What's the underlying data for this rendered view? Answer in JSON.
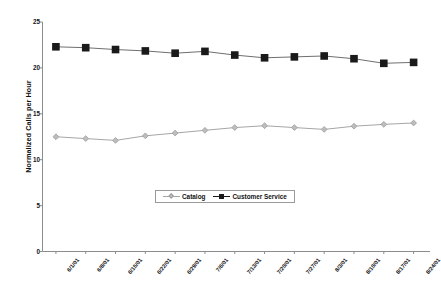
{
  "chart_data": {
    "type": "line",
    "title": "",
    "xlabel": "",
    "ylabel": "Normalized Calls per Hour",
    "ylim": [
      0,
      25
    ],
    "yticks": [
      0,
      5,
      10,
      15,
      20,
      25
    ],
    "grid": false,
    "legend_position": "bottom-center",
    "categories": [
      "6/1/01",
      "6/8/01",
      "6/15/01",
      "6/22/01",
      "6/29/01",
      "7/6/01",
      "7/13/01",
      "7/20/01",
      "7/27/01",
      "8/3/01",
      "8/10/01",
      "8/17/01",
      "8/24/01"
    ],
    "series": [
      {
        "name": "Catalog",
        "marker": "diamond",
        "color": "#a6a6a6",
        "values": [
          12.5,
          12.3,
          12.1,
          12.6,
          12.9,
          13.2,
          13.5,
          13.7,
          13.5,
          13.3,
          13.65,
          13.85,
          14.0
        ]
      },
      {
        "name": "Customer Service",
        "marker": "square",
        "color": "#1a1a1a",
        "values": [
          22.3,
          22.2,
          22.0,
          21.85,
          21.6,
          21.8,
          21.4,
          21.1,
          21.2,
          21.3,
          21.0,
          20.5,
          20.6
        ]
      }
    ]
  },
  "axis": {
    "y_title": "Normalized Calls per Hour",
    "y_tick_labels": [
      "25",
      "20",
      "15",
      "10",
      "5",
      "0"
    ],
    "x_tick_labels": [
      "6/1/01",
      "6/8/01",
      "6/15/01",
      "6/22/01",
      "6/29/01",
      "7/6/01",
      "7/13/01",
      "7/20/01",
      "7/27/01",
      "8/3/01",
      "8/10/01",
      "8/17/01",
      "8/24/01"
    ]
  },
  "legend": {
    "entries": [
      {
        "label": "Catalog"
      },
      {
        "label": "Customer Service"
      }
    ]
  },
  "colors": {
    "catalog": "#a6a6a6",
    "customer_service": "#1a1a1a",
    "axis": "#8c8c8c",
    "text": "#111111",
    "background": "#ffffff"
  }
}
